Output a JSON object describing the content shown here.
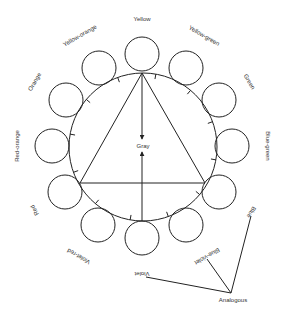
{
  "diagram": {
    "center_label": "Gray",
    "big_circle": {
      "cx": 143,
      "cy": 147,
      "r": 74
    },
    "color_spokes": [
      {
        "label": "Yellow",
        "circle": [
          142,
          54
        ],
        "label_pos": [
          142,
          19
        ],
        "rot": 0
      },
      {
        "label": "Yellow-green",
        "circle": [
          186,
          68
        ],
        "label_pos": [
          204,
          36
        ],
        "rot": 30
      },
      {
        "label": "Green",
        "circle": [
          219,
          100
        ],
        "label_pos": [
          249,
          82
        ],
        "rot": 60
      },
      {
        "label": "Blue-green",
        "circle": [
          232,
          146
        ],
        "label_pos": [
          268,
          146
        ],
        "rot": 90
      },
      {
        "label": "Blue",
        "circle": [
          219,
          192
        ],
        "label_pos": [
          251,
          212
        ],
        "rot": 120
      },
      {
        "label": "Blue-violet",
        "circle": [
          186,
          225
        ],
        "label_pos": [
          207,
          256
        ],
        "rot": 150
      },
      {
        "label": "Violet",
        "circle": [
          142,
          238
        ],
        "label_pos": [
          142,
          274
        ],
        "rot": 180
      },
      {
        "label": "Violet-red",
        "circle": [
          98,
          225
        ],
        "label_pos": [
          79,
          256
        ],
        "rot": 210
      },
      {
        "label": "Red",
        "circle": [
          65,
          192
        ],
        "label_pos": [
          35,
          210
        ],
        "rot": 240
      },
      {
        "label": "Red-orange",
        "circle": [
          52,
          146
        ],
        "label_pos": [
          17,
          146
        ],
        "rot": 270
      },
      {
        "label": "Orange",
        "circle": [
          66,
          100
        ],
        "label_pos": [
          35,
          82
        ],
        "rot": 300
      },
      {
        "label": "Yellow-orange",
        "circle": [
          99,
          68
        ],
        "label_pos": [
          80,
          36
        ],
        "rot": 330
      }
    ],
    "triangle": [
      [
        142,
        73
      ],
      [
        80,
        183
      ],
      [
        205,
        183
      ]
    ],
    "analogous": {
      "label": "Analogous",
      "label_pos": [
        233,
        299
      ],
      "vertex": [
        231,
        293
      ],
      "targets": [
        [
          251,
          216
        ],
        [
          207,
          259
        ],
        [
          146,
          277
        ]
      ]
    }
  }
}
